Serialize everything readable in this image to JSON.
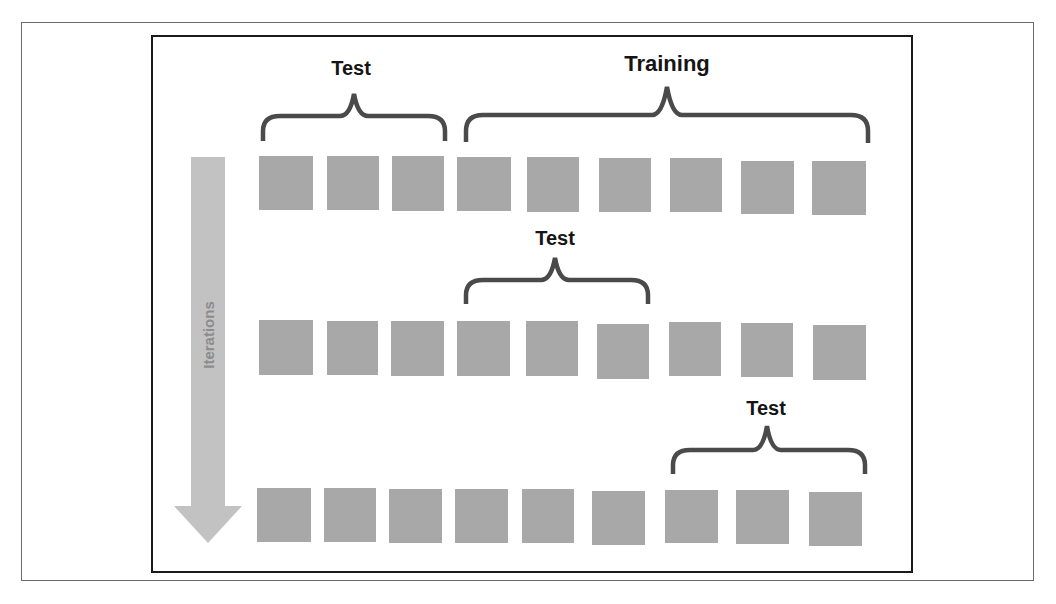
{
  "diagram": {
    "axis_label": "Iterations",
    "colors": {
      "square_fill": "#a8a8a8",
      "arrow_fill": "#c2c2c2",
      "arrow_text": "#8c8c8c",
      "bracket_stroke": "#4a4a4a",
      "label_text": "#151515",
      "inner_border": "#1a1a1a",
      "outer_border": "#6b6b6b"
    },
    "rows": [
      {
        "iteration": 1,
        "squares": 9,
        "brackets": [
          {
            "label": "Test",
            "covers": [
              1,
              3
            ]
          },
          {
            "label": "Training",
            "covers": [
              4,
              9
            ]
          }
        ]
      },
      {
        "iteration": 2,
        "squares": 9,
        "brackets": [
          {
            "label": "Test",
            "covers": [
              4,
              6
            ]
          }
        ]
      },
      {
        "iteration": 3,
        "squares": 9,
        "brackets": [
          {
            "label": "Test",
            "covers": [
              7,
              9
            ]
          }
        ]
      }
    ],
    "labels": {
      "row1_test": "Test",
      "row1_training": "Training",
      "row2_test": "Test",
      "row3_test": "Test"
    }
  }
}
